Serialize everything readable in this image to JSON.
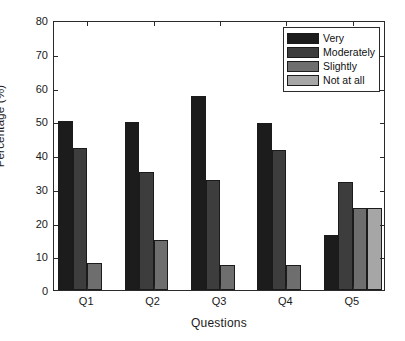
{
  "chart_data": {
    "type": "bar",
    "title": "",
    "xlabel": "Questions",
    "ylabel": "Percentage (%)",
    "categories": [
      "Q1",
      "Q2",
      "Q3",
      "Q4",
      "Q5"
    ],
    "ylim": [
      0,
      80
    ],
    "yticks": [
      0,
      10,
      20,
      30,
      40,
      50,
      60,
      70,
      80
    ],
    "grid": false,
    "legend_position": "top-right",
    "series": [
      {
        "name": "Very",
        "color": "#1c1c1c",
        "values": [
          50.0,
          49.8,
          57.6,
          49.4,
          16.2
        ]
      },
      {
        "name": "Moderately",
        "color": "#3d3d3d",
        "values": [
          42.0,
          34.9,
          32.5,
          41.4,
          32.1
        ]
      },
      {
        "name": "Slightly",
        "color": "#6e6e6e",
        "values": [
          8.0,
          14.8,
          7.5,
          7.4,
          24.2
        ]
      },
      {
        "name": "Not at all",
        "color": "#a6a6a6",
        "values": [
          0.0,
          0.0,
          0.0,
          0.0,
          24.2
        ]
      }
    ]
  },
  "axis": {
    "y_label": "Percentage (%)",
    "x_label": "Questions",
    "y_ticks": [
      "0",
      "10",
      "20",
      "30",
      "40",
      "50",
      "60",
      "70",
      "80"
    ],
    "x_ticks": [
      "Q1",
      "Q2",
      "Q3",
      "Q4",
      "Q5"
    ]
  },
  "legend": {
    "items": [
      {
        "label": "Very"
      },
      {
        "label": "Moderately"
      },
      {
        "label": "Slightly"
      },
      {
        "label": "Not at all"
      }
    ]
  }
}
